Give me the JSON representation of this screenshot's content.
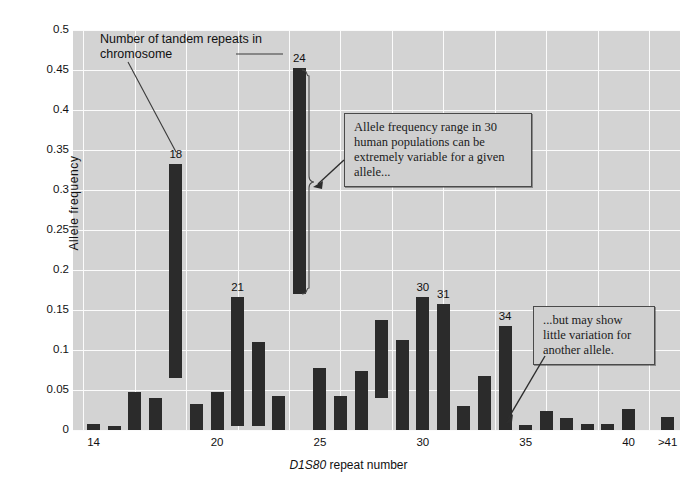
{
  "figure": {
    "background": "#ffffff",
    "plot_background": "#d3d3d3",
    "bar_color": "#2b2b2b",
    "grid_color": "#fbfbfb"
  },
  "annotations": {
    "tandem_label": "Number of tandem repeats in chromosome",
    "callout_variable": "Allele frequency range in 30 human populations can be extremely variable for a given allele...",
    "callout_little": "...but may show little variation for another allele."
  },
  "chart_data": {
    "type": "bar",
    "title": "",
    "xlabel_prefix": "D1S80",
    "xlabel_suffix": " repeat number",
    "ylabel": "Allele frequency",
    "ylim": [
      0,
      0.5
    ],
    "ytick_labels": [
      "0",
      "0.05",
      "0.1",
      "0.15",
      "0.2",
      "0.25",
      "0.3",
      "0.35",
      "0.4",
      "0.45",
      "0.5"
    ],
    "ytick_values": [
      0,
      0.05,
      0.1,
      0.15,
      0.2,
      0.25,
      0.3,
      0.35,
      0.4,
      0.45,
      0.5
    ],
    "xtick_labels": [
      "14",
      "20",
      "25",
      "30",
      "35",
      "40",
      ">41"
    ],
    "xtick_values": [
      14,
      20,
      25,
      30,
      35,
      40,
      41.9
    ],
    "grid": true,
    "legend": "none",
    "bar_kind": "floating-range",
    "note": "Each bar spans the minimum-to-maximum allele frequency observed across 30 human populations for that repeat number.",
    "categories": [
      14,
      15,
      16,
      17,
      18,
      19,
      20,
      21,
      22,
      23,
      24,
      25,
      26,
      27,
      28,
      29,
      30,
      31,
      32,
      33,
      34,
      35,
      36,
      37,
      38,
      39,
      40,
      41.9
    ],
    "low": [
      0.0,
      0.0,
      0.0,
      0.0,
      0.065,
      0.0,
      0.0,
      0.005,
      0.005,
      0.0,
      0.17,
      0.0,
      0.0,
      0.0,
      0.04,
      0.0,
      0.0,
      0.0,
      0.0,
      0.0,
      0.0,
      0.0,
      0.0,
      0.0,
      0.0,
      0.0,
      0.0,
      0.0
    ],
    "high": [
      0.008,
      0.005,
      0.048,
      0.04,
      0.332,
      0.033,
      0.047,
      0.166,
      0.11,
      0.042,
      0.453,
      0.077,
      0.042,
      0.074,
      0.138,
      0.113,
      0.166,
      0.158,
      0.03,
      0.068,
      0.13,
      0.006,
      0.024,
      0.015,
      0.007,
      0.007,
      0.026,
      0.016
    ],
    "labeled_bars": [
      {
        "category": 18,
        "label": "18"
      },
      {
        "category": 21,
        "label": "21"
      },
      {
        "category": 24,
        "label": "24"
      },
      {
        "category": 30,
        "label": "30"
      },
      {
        "category": 31,
        "label": "31"
      },
      {
        "category": 34,
        "label": "34"
      }
    ]
  }
}
